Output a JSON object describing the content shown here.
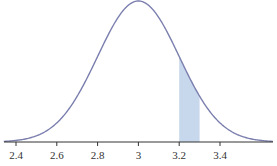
{
  "chart_data": {
    "type": "area",
    "title": "",
    "xlabel": "",
    "ylabel": "",
    "distribution": "normal",
    "mean": 3.0,
    "std": 0.2,
    "x_ticks": [
      "2.4",
      "2.6",
      "2.8",
      "3",
      "3.2",
      "3.4"
    ],
    "x_tick_values": [
      2.4,
      2.6,
      2.8,
      3.0,
      3.2,
      3.4
    ],
    "xlim": [
      2.34,
      3.66
    ],
    "shaded_region": {
      "from": 3.2,
      "to": 3.3
    },
    "grid": false,
    "legend": null
  },
  "colors": {
    "curve": "#7b7fae",
    "shade": "#c8d8ec",
    "axis": "#333333"
  }
}
